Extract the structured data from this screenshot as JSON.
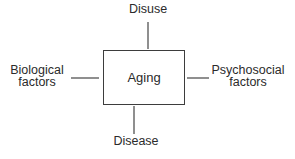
{
  "diagram": {
    "type": "concept-diagram",
    "center": {
      "label": "Aging"
    },
    "nodes": {
      "top": {
        "label": "Disuse"
      },
      "bottom": {
        "label": "Disease"
      },
      "left": {
        "label": "Biological\nfactors"
      },
      "right": {
        "label": "Psychosocial\nfactors"
      }
    },
    "connectors": [
      {
        "from": "top",
        "to": "center"
      },
      {
        "from": "bottom",
        "to": "center"
      },
      {
        "from": "left",
        "to": "center"
      },
      {
        "from": "right",
        "to": "center"
      }
    ],
    "colors": {
      "background": "#ffffff",
      "box_border": "#3d3d3d",
      "connector": "#8f8f8f",
      "text": "#2b2b2b"
    }
  }
}
